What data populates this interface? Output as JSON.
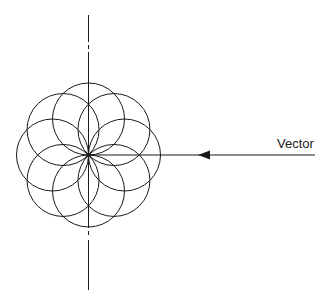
{
  "diagram": {
    "circle_count": 8,
    "vector_label": "Vector",
    "stroke_color": "#1a1a1a",
    "background_color": "#ffffff"
  }
}
